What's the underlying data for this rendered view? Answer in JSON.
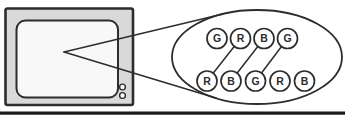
{
  "magnified_view": {
    "top_row": [
      "G",
      "R",
      "B",
      "G"
    ],
    "bottom_row": [
      "R",
      "B",
      "G",
      "R",
      "B"
    ],
    "connections": [
      {
        "top": 1,
        "bottom": 0
      },
      {
        "top": 2,
        "bottom": 1
      },
      {
        "top": 3,
        "bottom": 2
      }
    ]
  },
  "colors": {
    "outline": "#2d2d2d",
    "bezel_fill": "#d9d9d9",
    "screen_fill": "#f8f8f8",
    "background": "#ffffff",
    "bottom_bar": "#1b1b1b"
  }
}
